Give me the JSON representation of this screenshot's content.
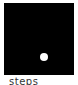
{
  "panel": {
    "background": "#000000",
    "dot": {
      "color": "#ffffff",
      "cx": 40,
      "cy": 54
    }
  },
  "caption": "steps"
}
